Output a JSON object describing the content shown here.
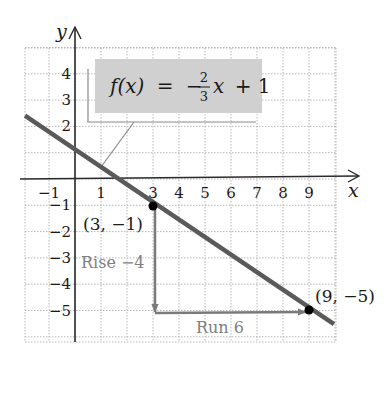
{
  "chart_data": {
    "type": "line",
    "title": "",
    "equation": {
      "text": "f(x) = -2/3 x + 1",
      "lhs": "f(x)",
      "equals": "=",
      "minus": "−",
      "numerator": "2",
      "denominator": "3",
      "var": "x",
      "tail": "+ 1"
    },
    "slope": -0.6667,
    "intercept": 1,
    "xlabel": "x",
    "ylabel": "y",
    "xlim": [
      -1.9,
      10
    ],
    "ylim": [
      -6.2,
      5.1
    ],
    "grid": true,
    "x_ticks": [
      -1,
      1,
      3,
      4,
      5,
      6,
      7,
      8,
      9
    ],
    "x_tick_labels": [
      "−1",
      "1",
      "3",
      "4",
      "5",
      "6",
      "7",
      "8",
      "9"
    ],
    "y_ticks": [
      4,
      3,
      2,
      -1,
      -2,
      -3,
      -4,
      -5
    ],
    "y_tick_labels": [
      "4",
      "3",
      "2",
      "−1",
      "−2",
      "−3",
      "−4",
      "−5"
    ],
    "line_segment": {
      "x": [
        -2.0,
        10.0
      ],
      "y": [
        2.33,
        -5.67
      ]
    },
    "points": [
      {
        "x": 3,
        "y": -1,
        "label": "(3, −1)"
      },
      {
        "x": 9,
        "y": -5,
        "label": "(9, −5)"
      }
    ],
    "annotations": [
      {
        "type": "arrow",
        "from": [
          3,
          -1
        ],
        "to": [
          3,
          -5
        ],
        "label": "Rise −4"
      },
      {
        "type": "arrow",
        "from": [
          3,
          -5
        ],
        "to": [
          9,
          -5
        ],
        "label": "Run 6"
      }
    ],
    "colors": {
      "line": "#5a5a5a",
      "axes": "#2a2a2a",
      "grid": "#b8b8b8",
      "arrows": "#7a7a7a",
      "equation_box": "#d0d0d0",
      "points": "#000000"
    }
  }
}
